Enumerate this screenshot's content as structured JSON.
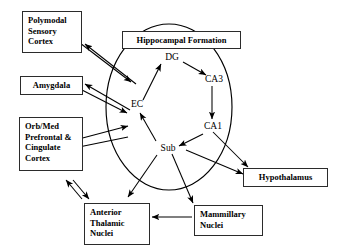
{
  "diagram": {
    "circle_label": "Hippocampal Formation",
    "stroke_color": "#000000",
    "background_color": "#ffffff",
    "boxes": [
      {
        "id": "polymodal-sensory-cortex",
        "lines": [
          "Polymodal",
          "Sensory",
          "Cortex"
        ]
      },
      {
        "id": "amygdala",
        "lines": [
          "Amygdala"
        ]
      },
      {
        "id": "orb-med-prefrontal-cingulate-cortex",
        "lines": [
          "Orb/Med",
          "Prefrontal &",
          "Cingulate",
          "Cortex"
        ]
      },
      {
        "id": "hippocampal-formation",
        "lines": [
          "Hippocampal Formation"
        ]
      },
      {
        "id": "anterior-thalamic-nuclei",
        "lines": [
          "Anterior",
          "Thalamic",
          "Nuclei"
        ]
      },
      {
        "id": "mammillary-nuclei",
        "lines": [
          "Mammillary",
          "Nuclei"
        ]
      },
      {
        "id": "hypothalamus",
        "lines": [
          "Hypothalamus"
        ]
      }
    ],
    "nodes": [
      {
        "id": "dg",
        "label": "DG"
      },
      {
        "id": "ca3",
        "label": "CA3"
      },
      {
        "id": "ca1",
        "label": "CA1"
      },
      {
        "id": "sub",
        "label": "Sub"
      },
      {
        "id": "ec",
        "label": "EC"
      }
    ],
    "connections": [
      {
        "from": "EC",
        "to": "DG",
        "type": "directed"
      },
      {
        "from": "DG",
        "to": "CA3",
        "type": "directed"
      },
      {
        "from": "CA3",
        "to": "CA1",
        "type": "directed"
      },
      {
        "from": "CA1",
        "to": "Sub",
        "type": "directed"
      },
      {
        "from": "Sub",
        "to": "EC",
        "type": "directed"
      },
      {
        "from": "Polymodal Sensory Cortex",
        "to": "EC",
        "type": "bidirectional"
      },
      {
        "from": "Amygdala",
        "to": "EC",
        "type": "bidirectional"
      },
      {
        "from": "Orb/Med Prefrontal & Cingulate Cortex",
        "to": "EC",
        "type": "bidirectional"
      },
      {
        "from": "Sub",
        "to": "Hypothalamus",
        "type": "directed"
      },
      {
        "from": "CA1",
        "to": "Hypothalamus",
        "type": "directed"
      },
      {
        "from": "Sub",
        "to": "Mammillary Nuclei",
        "type": "directed"
      },
      {
        "from": "Sub",
        "to": "Anterior Thalamic Nuclei",
        "type": "directed"
      },
      {
        "from": "Mammillary Nuclei",
        "to": "Anterior Thalamic Nuclei",
        "type": "directed"
      },
      {
        "from": "Anterior Thalamic Nuclei",
        "to": "Orb/Med Prefrontal & Cingulate Cortex",
        "type": "bidirectional"
      }
    ]
  }
}
